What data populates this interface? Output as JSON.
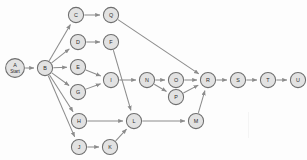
{
  "diagram": {
    "background_color": "#fdfdfd",
    "node_fill": "#e2e2e2",
    "node_stroke": "#6e6e6e",
    "edge_color": "#8c8c8c",
    "label_color": "#2b2b2b",
    "node_radius": 7.6,
    "start_node_radius": 9.4,
    "nodes": [
      {
        "id": "A",
        "label": "A",
        "sublabel": "Start",
        "x": 15,
        "y": 68,
        "r": 9.4
      },
      {
        "id": "B",
        "label": "B",
        "sublabel": "",
        "x": 45,
        "y": 68,
        "r": 7.6
      },
      {
        "id": "C",
        "label": "C",
        "sublabel": "",
        "x": 76,
        "y": 15,
        "r": 7.6
      },
      {
        "id": "Q",
        "label": "Q",
        "sublabel": "",
        "x": 111,
        "y": 15,
        "r": 7.6
      },
      {
        "id": "D",
        "label": "D",
        "sublabel": "",
        "x": 78,
        "y": 42,
        "r": 7.6
      },
      {
        "id": "F",
        "label": "F",
        "sublabel": "",
        "x": 111,
        "y": 42,
        "r": 7.6
      },
      {
        "id": "E",
        "label": "E",
        "sublabel": "",
        "x": 78,
        "y": 67,
        "r": 7.6
      },
      {
        "id": "G",
        "label": "G",
        "sublabel": "",
        "x": 78,
        "y": 92,
        "r": 7.6
      },
      {
        "id": "I",
        "label": "I",
        "sublabel": "",
        "x": 111,
        "y": 80,
        "r": 7.6
      },
      {
        "id": "N",
        "label": "N",
        "sublabel": "",
        "x": 147,
        "y": 80,
        "r": 7.6
      },
      {
        "id": "O",
        "label": "O",
        "sublabel": "",
        "x": 176,
        "y": 80,
        "r": 7.6
      },
      {
        "id": "P",
        "label": "P",
        "sublabel": "",
        "x": 176,
        "y": 97,
        "r": 7.6
      },
      {
        "id": "R",
        "label": "R",
        "sublabel": "",
        "x": 208,
        "y": 80,
        "r": 7.6
      },
      {
        "id": "S",
        "label": "S",
        "sublabel": "",
        "x": 238,
        "y": 80,
        "r": 7.6
      },
      {
        "id": "T",
        "label": "T",
        "sublabel": "",
        "x": 268,
        "y": 80,
        "r": 7.6
      },
      {
        "id": "U",
        "label": "U",
        "sublabel": "",
        "x": 298,
        "y": 80,
        "r": 7.6
      },
      {
        "id": "H",
        "label": "H",
        "sublabel": "",
        "x": 79,
        "y": 121,
        "r": 7.6
      },
      {
        "id": "L",
        "label": "L",
        "sublabel": "",
        "x": 134,
        "y": 121,
        "r": 7.6
      },
      {
        "id": "M",
        "label": "M",
        "sublabel": "",
        "x": 196,
        "y": 121,
        "r": 7.6
      },
      {
        "id": "J",
        "label": "J",
        "sublabel": "",
        "x": 79,
        "y": 147,
        "r": 7.6
      },
      {
        "id": "K",
        "label": "K",
        "sublabel": "",
        "x": 110,
        "y": 147,
        "r": 7.6
      }
    ],
    "edges": [
      {
        "from": "A",
        "to": "B"
      },
      {
        "from": "B",
        "to": "C"
      },
      {
        "from": "B",
        "to": "D"
      },
      {
        "from": "B",
        "to": "E"
      },
      {
        "from": "B",
        "to": "G"
      },
      {
        "from": "B",
        "to": "H"
      },
      {
        "from": "B",
        "to": "J"
      },
      {
        "from": "C",
        "to": "Q"
      },
      {
        "from": "D",
        "to": "F"
      },
      {
        "from": "Q",
        "to": "R"
      },
      {
        "from": "F",
        "to": "L"
      },
      {
        "from": "E",
        "to": "I"
      },
      {
        "from": "G",
        "to": "I"
      },
      {
        "from": "I",
        "to": "N"
      },
      {
        "from": "N",
        "to": "O"
      },
      {
        "from": "N",
        "to": "P"
      },
      {
        "from": "O",
        "to": "R"
      },
      {
        "from": "P",
        "to": "R"
      },
      {
        "from": "R",
        "to": "S"
      },
      {
        "from": "S",
        "to": "T"
      },
      {
        "from": "T",
        "to": "U"
      },
      {
        "from": "H",
        "to": "L"
      },
      {
        "from": "J",
        "to": "K"
      },
      {
        "from": "K",
        "to": "L"
      },
      {
        "from": "L",
        "to": "M"
      },
      {
        "from": "M",
        "to": "R"
      }
    ]
  }
}
